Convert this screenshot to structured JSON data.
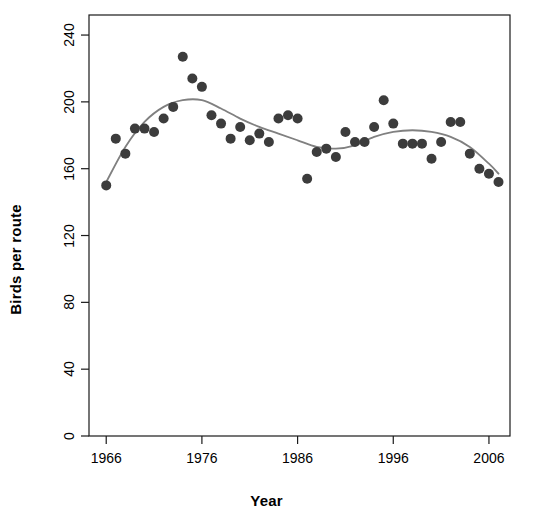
{
  "chart_data": {
    "type": "scatter",
    "title": "",
    "xlabel": "Year",
    "ylabel": "Birds per route",
    "xlim": [
      1964.2,
      2008.2
    ],
    "ylim": [
      0,
      252
    ],
    "grid": false,
    "legend": null,
    "xticks": [
      1966,
      1976,
      1986,
      1996,
      2006
    ],
    "yticks": [
      0,
      40,
      80,
      120,
      160,
      200,
      240
    ],
    "point_color": "#3c3c3c",
    "line_color": "#808080",
    "series": [
      {
        "name": "Birds per route",
        "type": "scatter",
        "x": [
          1966,
          1967,
          1968,
          1969,
          1970,
          1971,
          1972,
          1973,
          1974,
          1975,
          1976,
          1977,
          1978,
          1979,
          1980,
          1981,
          1982,
          1983,
          1984,
          1985,
          1986,
          1987,
          1988,
          1989,
          1990,
          1991,
          1992,
          1993,
          1994,
          1995,
          1996,
          1997,
          1998,
          1999,
          2000,
          2001,
          2002,
          2003,
          2004,
          2005,
          2006,
          2007
        ],
        "y": [
          150,
          178,
          169,
          184,
          184,
          182,
          190,
          197,
          227,
          214,
          209,
          192,
          187,
          178,
          185,
          177,
          181,
          176,
          190,
          192,
          190,
          154,
          170,
          172,
          167,
          182,
          176,
          176,
          185,
          201,
          187,
          175,
          175,
          175,
          166,
          176,
          188,
          188,
          169,
          160,
          157,
          152
        ]
      },
      {
        "name": "LOESS smooth",
        "type": "line",
        "x": [
          1966,
          1968,
          1970,
          1972,
          1974,
          1976,
          1978,
          1980,
          1982,
          1984,
          1986,
          1988,
          1990,
          1992,
          1994,
          1996,
          1998,
          2000,
          2002,
          2004,
          2006,
          2007
        ],
        "y": [
          152,
          173,
          188,
          197,
          201,
          201,
          196,
          190,
          185,
          181,
          177,
          173,
          172,
          174,
          179,
          182,
          183,
          182,
          179,
          173,
          163,
          157
        ]
      }
    ]
  },
  "axes": {
    "x_title": "Year",
    "y_title": "Birds per route",
    "x_tick_labels": [
      "1966",
      "1976",
      "1986",
      "1996",
      "2006"
    ],
    "y_tick_labels": [
      "0",
      "40",
      "80",
      "120",
      "160",
      "200",
      "240"
    ]
  }
}
